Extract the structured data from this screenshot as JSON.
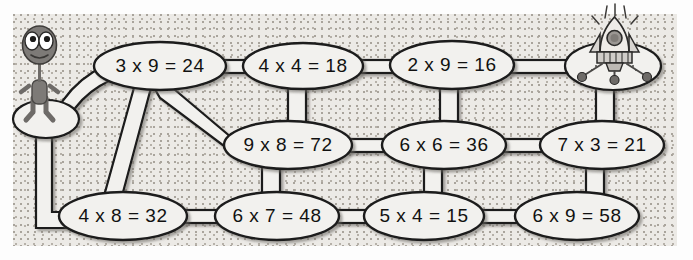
{
  "page": {
    "background_color": "#fdfdfd",
    "panel_color": "#eceae6",
    "path_fill_color": "#f2f1ee",
    "path_stroke_color": "#1a1a1a",
    "text_color": "#111111",
    "character_color": "#807d7a"
  },
  "characters": {
    "start": {
      "name": "alien",
      "label": "alien-character",
      "position": "left"
    },
    "goal": {
      "name": "rocket",
      "label": "rocket-ship",
      "position": "top-right"
    }
  },
  "maze": {
    "rows": [
      {
        "row": "top",
        "nodes": [
          {
            "id": "n1",
            "text": "3 x 9 = 24",
            "a": 3,
            "b": 9,
            "answer": 24,
            "correct": false,
            "cx": 160,
            "cy": 66,
            "rx": 66,
            "ry": 24
          },
          {
            "id": "n2",
            "text": "4 x 4 = 18",
            "a": 4,
            "b": 4,
            "answer": 18,
            "correct": false,
            "cx": 303,
            "cy": 66,
            "rx": 60,
            "ry": 23
          },
          {
            "id": "n3",
            "text": "2 x 9 = 16",
            "a": 2,
            "b": 9,
            "answer": 16,
            "correct": false,
            "cx": 452,
            "cy": 65,
            "rx": 62,
            "ry": 24
          }
        ]
      },
      {
        "row": "middle",
        "nodes": [
          {
            "id": "n4",
            "text": "9 x 8 = 72",
            "a": 9,
            "b": 8,
            "answer": 72,
            "correct": true,
            "cx": 288,
            "cy": 145,
            "rx": 64,
            "ry": 24
          },
          {
            "id": "n5",
            "text": "6 x 6 = 36",
            "a": 6,
            "b": 6,
            "answer": 36,
            "correct": true,
            "cx": 444,
            "cy": 145,
            "rx": 62,
            "ry": 24
          },
          {
            "id": "n6",
            "text": "7 x 3 = 21",
            "a": 7,
            "b": 3,
            "answer": 21,
            "correct": true,
            "cx": 602,
            "cy": 145,
            "rx": 62,
            "ry": 24
          }
        ]
      },
      {
        "row": "bottom",
        "nodes": [
          {
            "id": "n7",
            "text": "4 x 8 = 32",
            "a": 4,
            "b": 8,
            "answer": 32,
            "correct": true,
            "cx": 123,
            "cy": 216,
            "rx": 64,
            "ry": 24
          },
          {
            "id": "n8",
            "text": "6 x 7 = 48",
            "a": 6,
            "b": 7,
            "answer": 48,
            "correct": false,
            "cx": 277,
            "cy": 216,
            "rx": 62,
            "ry": 24
          },
          {
            "id": "n9",
            "text": "5 x 4 = 15",
            "a": 5,
            "b": 4,
            "answer": 15,
            "correct": false,
            "cx": 424,
            "cy": 216,
            "rx": 60,
            "ry": 24
          },
          {
            "id": "n10",
            "text": "6 x 9 = 58",
            "a": 6,
            "b": 9,
            "answer": 58,
            "correct": false,
            "cx": 577,
            "cy": 216,
            "rx": 62,
            "ry": 24
          }
        ]
      }
    ],
    "pads": [
      {
        "id": "start-pad",
        "name": "alien-landing-pad",
        "cx": 46,
        "cy": 119,
        "rx": 33,
        "ry": 19
      },
      {
        "id": "goal-pad",
        "name": "rocket-landing-pad",
        "cx": 613,
        "cy": 66,
        "rx": 48,
        "ry": 24
      }
    ]
  }
}
